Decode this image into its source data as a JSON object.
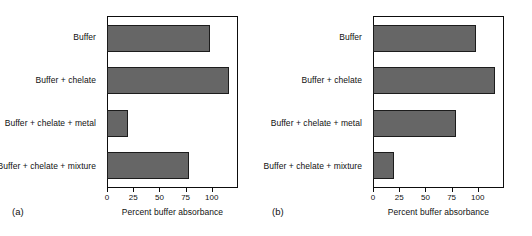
{
  "figure": {
    "background_color": "#ffffff",
    "bar_color": "#666666",
    "bar_edge_color": "#1c1c1c",
    "axis_color": "#0d0d0d"
  },
  "panels": [
    {
      "tag": "(a)",
      "xlabel": "Percent buffer absorbance",
      "ticks": [
        "0",
        "25",
        "50",
        "75",
        "100"
      ],
      "categories": [
        "Buffer",
        "Buffer + chelate",
        "Buffer + chelate + metal",
        "Buffer + chelate + mixture"
      ]
    },
    {
      "tag": "(b)",
      "xlabel": "Percent buffer absorbance",
      "ticks": [
        "0",
        "25",
        "50",
        "75",
        "100"
      ],
      "categories": [
        "Buffer",
        "Buffer + chelate",
        "Buffer + chelate + metal",
        "Buffer + chelate + mixture"
      ]
    }
  ],
  "chart_data": [
    {
      "type": "bar",
      "orientation": "horizontal",
      "title": "(a)",
      "xlabel": "Percent buffer absorbance",
      "ylabel": "",
      "categories": [
        "Buffer",
        "Buffer + chelate",
        "Buffer + chelate + metal",
        "Buffer + chelate + mixture"
      ],
      "values": [
        100,
        118,
        20,
        79
      ],
      "xlim": [
        0,
        125
      ],
      "xticks": [
        0,
        25,
        50,
        75,
        100
      ],
      "grid": false,
      "legend": false,
      "bar_color": "#666666"
    },
    {
      "type": "bar",
      "orientation": "horizontal",
      "title": "(b)",
      "xlabel": "Percent buffer absorbance",
      "ylabel": "",
      "categories": [
        "Buffer",
        "Buffer + chelate",
        "Buffer + chelate + metal",
        "Buffer + chelate + mixture"
      ],
      "values": [
        100,
        118,
        80,
        20
      ],
      "xlim": [
        0,
        125
      ],
      "xticks": [
        0,
        25,
        50,
        75,
        100
      ],
      "grid": false,
      "legend": false,
      "bar_color": "#666666"
    }
  ]
}
